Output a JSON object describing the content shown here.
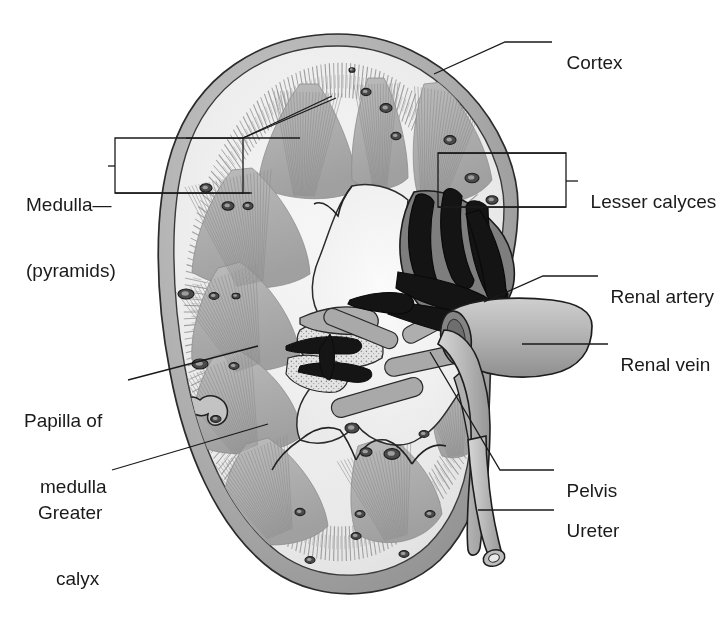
{
  "figure": {
    "type": "anatomical-illustration",
    "style": "grayscale medical line drawing",
    "canvas": {
      "width": 721,
      "height": 636
    }
  },
  "colors": {
    "background": "#ffffff",
    "outline": "#222222",
    "capsule_dark": "#9a9a9a",
    "capsule_mid": "#b5b5b5",
    "cortex_light": "#ececec",
    "cortex_shade": "#d8d8d8",
    "pyramid_gray": "#b0b0b0",
    "pyramid_dark": "#9c9c9c",
    "sinus_fat": "#f2f2f2",
    "vessel_gray": "#a8a8a8",
    "vessel_dark": "#7d7d7d",
    "artery_black": "#1d1d1d",
    "label_text": "#1a1a1a",
    "leader_line": "#1a1a1a"
  },
  "labels": [
    {
      "id": "cortex",
      "text": "Cortex",
      "lines": [
        "Cortex"
      ],
      "x": 556,
      "y": 32,
      "align": "left"
    },
    {
      "id": "medulla",
      "text": "Medulla (pyramids)",
      "lines": [
        "Medulla—",
        "(pyramids)"
      ],
      "x": 28,
      "y": 152,
      "align": "left"
    },
    {
      "id": "lesser-calyces",
      "text": "Lesser calyces",
      "lines": [
        "Lesser calyces"
      ],
      "x": 582,
      "y": 170,
      "align": "left"
    },
    {
      "id": "renal-artery",
      "text": "Renal artery",
      "lines": [
        "Renal artery"
      ],
      "x": 602,
      "y": 264,
      "align": "left"
    },
    {
      "id": "renal-vein",
      "text": "Renal vein",
      "lines": [
        "Renal vein"
      ],
      "x": 612,
      "y": 337,
      "align": "left"
    },
    {
      "id": "papilla",
      "text": "Papilla of medulla",
      "lines": [
        "Papilla of",
        "medulla"
      ],
      "x": 25,
      "y": 366,
      "align": "left"
    },
    {
      "id": "greater-calyx",
      "text": "Greater calyx",
      "lines": [
        "Greater",
        "calyx"
      ],
      "x": 40,
      "y": 458,
      "align": "left"
    },
    {
      "id": "pelvis",
      "text": "Pelvis",
      "lines": [
        "Pelvis"
      ],
      "x": 558,
      "y": 458,
      "align": "left"
    },
    {
      "id": "ureter",
      "text": "Ureter",
      "lines": [
        "Ureter"
      ],
      "x": 558,
      "y": 498,
      "align": "left"
    }
  ],
  "label_text": {
    "cortex": "Cortex",
    "medulla_line1": "Medulla—",
    "medulla_line2": "(pyramids)",
    "lesser_calyces": "Lesser calyces",
    "renal_artery": "Renal artery",
    "renal_vein": "Renal vein",
    "papilla_line1": "Papilla of",
    "papilla_line2": "medulla",
    "greater_line1": "Greater",
    "greater_line2": "calyx",
    "pelvis": "Pelvis",
    "ureter": "Ureter"
  },
  "structures": [
    {
      "name": "renal-capsule",
      "description": "outer fibrous capsule, dark gray rim"
    },
    {
      "name": "renal-cortex",
      "description": "pale outer zone with fine radial striations"
    },
    {
      "name": "renal-pyramids",
      "description": "gray triangular medullary pyramids with striations"
    },
    {
      "name": "renal-columns",
      "description": "cortical tissue between pyramids"
    },
    {
      "name": "renal-papilla",
      "description": "apex of pyramid projecting into minor calyx"
    },
    {
      "name": "minor-calyces",
      "description": "small cup-shaped collecting chambers"
    },
    {
      "name": "major-calyx",
      "description": "larger collecting chamber formed by minor calyces"
    },
    {
      "name": "renal-pelvis",
      "description": "funnel-shaped expansion draining into ureter"
    },
    {
      "name": "renal-artery",
      "description": "dark branching arterial tree at hilum"
    },
    {
      "name": "renal-vein",
      "description": "large pale tube exiting hilum"
    },
    {
      "name": "ureter",
      "description": "tube descending from pelvis, cut end visible"
    },
    {
      "name": "renal-sinus-fat",
      "description": "stippled fatty tissue within sinus"
    }
  ],
  "callout_boxes": [
    {
      "id": "medulla-box",
      "label_ref": "medulla",
      "x": 115,
      "y": 138,
      "width": 128,
      "height": 55
    },
    {
      "id": "calyces-box",
      "label_ref": "lesser-calyces",
      "x": 438,
      "y": 153,
      "width": 128,
      "height": 55
    }
  ]
}
